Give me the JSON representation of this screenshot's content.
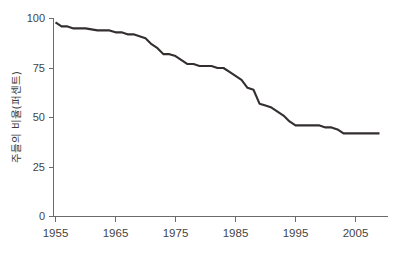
{
  "chart_data": {
    "type": "line",
    "title": "",
    "xlabel": "",
    "ylabel": "주들의 비율(퍼센트)",
    "xlim": [
      1954,
      2010
    ],
    "ylim": [
      0,
      100
    ],
    "grid": false,
    "legend": "none",
    "xticks": [
      1955,
      1965,
      1975,
      1985,
      1995,
      2005
    ],
    "xtick_labels": [
      "1955",
      "1965",
      "1975",
      "1985",
      "1995",
      "2005"
    ],
    "yticks": [
      0,
      25,
      50,
      75,
      100
    ],
    "ytick_labels": [
      "0",
      "25",
      "50",
      "75",
      "100"
    ],
    "series": [
      {
        "name": "주들의 비율(퍼센트)",
        "color": "#332f2e",
        "x": [
          1955,
          1956,
          1957,
          1958,
          1960,
          1962,
          1963,
          1964,
          1965,
          1966,
          1967,
          1968,
          1969,
          1970,
          1971,
          1972,
          1973,
          1974,
          1975,
          1976,
          1977,
          1978,
          1979,
          1980,
          1981,
          1982,
          1983,
          1984,
          1985,
          1986,
          1987,
          1988,
          1989,
          1990,
          1991,
          1992,
          1993,
          1994,
          1995,
          1996,
          1997,
          1998,
          1999,
          2000,
          2001,
          2002,
          2003,
          2004,
          2005,
          2006,
          2007,
          2008,
          2009
        ],
        "values": [
          98,
          96,
          96,
          95,
          95,
          94,
          94,
          94,
          93,
          93,
          92,
          92,
          91,
          90,
          87,
          85,
          82,
          82,
          81,
          79,
          77,
          77,
          76,
          76,
          76,
          75,
          75,
          73,
          71,
          69,
          65,
          64,
          57,
          56,
          55,
          53,
          51,
          48,
          46,
          46,
          46,
          46,
          46,
          45,
          45,
          44,
          42,
          42,
          42,
          42,
          42,
          42,
          42
        ]
      }
    ]
  },
  "axes": {
    "y_axis_title": "주들의 비율(퍼센트)"
  }
}
